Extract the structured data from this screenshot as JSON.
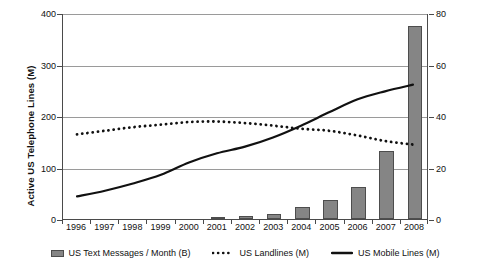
{
  "chart_data": {
    "type": "bar",
    "title": "",
    "xlabel": "",
    "ylabel": "Active US Telephone Lines (M)",
    "y2label": "US Mobile Messaging / Month (B)",
    "grid": true,
    "legend_position": "bottom",
    "categories": [
      "1996",
      "1997",
      "1998",
      "1999",
      "2000",
      "2001",
      "2002",
      "2003",
      "2004",
      "2005",
      "2006",
      "2007",
      "2008"
    ],
    "ylim": [
      0,
      400
    ],
    "yticks": [
      0,
      100,
      200,
      300,
      400
    ],
    "y2lim": [
      0,
      80
    ],
    "y2ticks": [
      0,
      20,
      40,
      60,
      80
    ],
    "series": [
      {
        "name": "US Text Messages / Month (B)",
        "type": "bar",
        "axis": "right",
        "color": "#858585",
        "values": [
          0,
          0,
          0,
          0,
          0,
          0.3,
          1.2,
          2.1,
          4.7,
          7.2,
          12.5,
          26.5,
          75.0
        ]
      },
      {
        "name": "US Landlines (M)",
        "type": "line",
        "style": "dotted",
        "axis": "left",
        "color": "#111111",
        "values": [
          165,
          172,
          179,
          184,
          189,
          190,
          187,
          182,
          176,
          172,
          163,
          152,
          145
        ]
      },
      {
        "name": "US Mobile Lines (M)",
        "type": "line",
        "style": "solid",
        "axis": "left",
        "color": "#111111",
        "values": [
          44,
          55,
          69,
          86,
          110,
          128,
          141,
          159,
          182,
          208,
          233,
          249,
          262
        ]
      }
    ]
  },
  "legend": {
    "items": [
      {
        "label": "US Text Messages / Month (B)",
        "marker": "bar-swatch"
      },
      {
        "label": "US Landlines (M)",
        "marker": "dotted-line-swatch"
      },
      {
        "label": "US Mobile Lines (M)",
        "marker": "solid-line-swatch"
      }
    ]
  }
}
